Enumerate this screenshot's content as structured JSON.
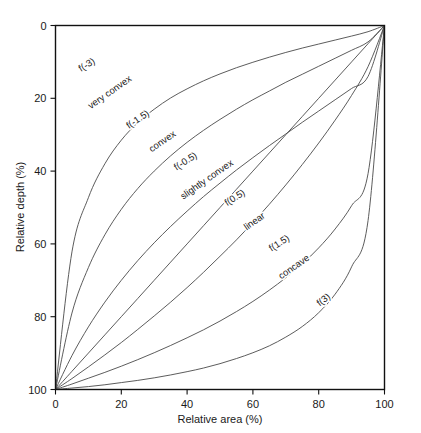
{
  "chart_data": {
    "type": "line",
    "title": "",
    "xlabel": "Relative area (%)",
    "ylabel": "Relative depth (%)",
    "xlim": [
      0,
      100
    ],
    "ylim": [
      100,
      0
    ],
    "y_inverted": true,
    "grid": false,
    "legend": "inline-curve-labels",
    "frame": "box",
    "xticks": [
      0,
      20,
      40,
      60,
      80,
      100
    ],
    "yticks": [
      0,
      20,
      40,
      60,
      80,
      100
    ],
    "xtick_labels": [
      "0",
      "20",
      "40",
      "60",
      "80",
      "100"
    ],
    "ytick_labels": [
      "0",
      "20",
      "40",
      "60",
      "80",
      "100"
    ],
    "x": [
      0,
      5,
      10,
      15,
      20,
      25,
      30,
      35,
      40,
      45,
      50,
      55,
      60,
      65,
      70,
      75,
      80,
      85,
      90,
      95,
      100
    ],
    "series": [
      {
        "name": "f(-3)",
        "label": "f(-3)",
        "shape_class": "very convex",
        "values": [
          100,
          62.2,
          47.3,
          38.0,
          31.5,
          26.7,
          23.0,
          19.9,
          17.4,
          15.2,
          13.3,
          11.6,
          10.1,
          8.7,
          7.4,
          6.2,
          5.1,
          4.0,
          2.9,
          1.7,
          0
        ]
      },
      {
        "name": "f(-1.5)",
        "label": "f(-1.5)",
        "shape_class": "convex",
        "values": [
          100,
          79.0,
          66.5,
          57.5,
          50.5,
          44.8,
          40.0,
          35.8,
          32.1,
          28.8,
          25.8,
          23.0,
          20.4,
          18.0,
          15.6,
          13.4,
          11.2,
          9.0,
          6.8,
          4.5,
          0
        ]
      },
      {
        "name": "f(-0.5)",
        "label": "f(-0.5)",
        "shape_class": "slightly convex",
        "values": [
          100,
          90.7,
          82.8,
          76.0,
          70.0,
          64.6,
          59.7,
          55.2,
          51.0,
          47.0,
          43.3,
          39.7,
          36.3,
          33.0,
          29.8,
          26.6,
          23.5,
          20.4,
          17.3,
          14.0,
          0
        ]
      },
      {
        "name": "linear",
        "label": "f(0.5)",
        "shape_class": "linear",
        "values": [
          100,
          95,
          90,
          85,
          80,
          75,
          70,
          65,
          60,
          55,
          50,
          45,
          40,
          35,
          30,
          25,
          20,
          15,
          10,
          5,
          0
        ]
      },
      {
        "name": "f(0.5)",
        "label": "",
        "shape_class": "",
        "values": [
          100,
          97.0,
          93.8,
          90.5,
          87.1,
          83.5,
          79.8,
          76.0,
          72.0,
          67.8,
          63.4,
          58.9,
          54.1,
          49.1,
          43.8,
          38.2,
          32.3,
          26.0,
          19.2,
          11.3,
          0
        ]
      },
      {
        "name": "f(1.5)",
        "label": "f(1.5)",
        "shape_class": "concave",
        "values": [
          100,
          98.5,
          96.9,
          95.3,
          93.6,
          91.8,
          89.9,
          87.9,
          85.8,
          83.6,
          81.2,
          78.6,
          75.8,
          72.7,
          69.3,
          65.5,
          61.1,
          55.9,
          49.5,
          40.7,
          0
        ]
      },
      {
        "name": "f(3)",
        "label": "f(3)",
        "shape_class": "",
        "values": [
          100,
          99.6,
          99.2,
          98.7,
          98.1,
          97.5,
          96.8,
          96.0,
          95.1,
          94.1,
          92.9,
          91.5,
          89.9,
          88.0,
          85.6,
          82.7,
          78.9,
          73.8,
          66.3,
          53.6,
          0
        ]
      }
    ],
    "curve_labels": [
      {
        "text": "f(-3)",
        "x_pct": 10.0,
        "depth_pct": 11.5,
        "rotation": -32
      },
      {
        "text": "f(-1.5)",
        "x_pct": 25.5,
        "depth_pct": 26.5,
        "rotation": -34
      },
      {
        "text": "f(-0.5)",
        "x_pct": 40.0,
        "depth_pct": 38.0,
        "rotation": -33
      },
      {
        "text": "f(0.5)",
        "x_pct": 55.0,
        "depth_pct": 48.0,
        "rotation": -33
      },
      {
        "text": "f(1.5)",
        "x_pct": 68.5,
        "depth_pct": 60.5,
        "rotation": -33
      },
      {
        "text": "f(3)",
        "x_pct": 82.0,
        "depth_pct": 76.0,
        "rotation": -38
      }
    ],
    "shape_labels": [
      {
        "text": "very convex",
        "x_pct": 17.0,
        "depth_pct": 19.0,
        "rotation": -35
      },
      {
        "text": "convex",
        "x_pct": 33.0,
        "depth_pct": 32.5,
        "rotation": -35
      },
      {
        "text": "slightly convex",
        "x_pct": 46.5,
        "depth_pct": 43.0,
        "rotation": -35
      },
      {
        "text": "linear",
        "x_pct": 61.0,
        "depth_pct": 54.5,
        "rotation": -35
      },
      {
        "text": "concave",
        "x_pct": 73.0,
        "depth_pct": 67.0,
        "rotation": -35
      }
    ]
  }
}
